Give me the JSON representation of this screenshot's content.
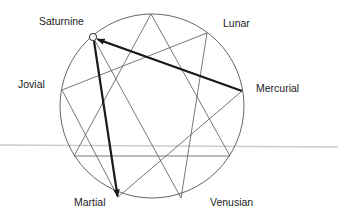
{
  "diagram": {
    "type": "enneagram",
    "labels": {
      "saturnine": "Saturnine",
      "lunar": "Lunar",
      "jovial": "Jovial",
      "mercurial": "Mercurial",
      "martial": "Martial",
      "venusian": "Venusian"
    },
    "colors": {
      "background": "#ffffff",
      "figure_lines": "#555555",
      "arrows": "#1a1a1a",
      "divider": "#cccccc",
      "text": "#222222"
    },
    "circle": {
      "cx": 152,
      "cy": 106,
      "r": 92
    },
    "vertices": [
      {
        "id": "top",
        "x": 151,
        "y": 14
      },
      {
        "id": "upper-right",
        "x": 207,
        "y": 33
      },
      {
        "id": "mercurial",
        "x": 242,
        "y": 91
      },
      {
        "id": "lower-right",
        "x": 230,
        "y": 156
      },
      {
        "id": "venusian",
        "x": 181,
        "y": 198
      },
      {
        "id": "martial",
        "x": 118,
        "y": 197
      },
      {
        "id": "lower-left",
        "x": 74,
        "y": 156
      },
      {
        "id": "jovial",
        "x": 62,
        "y": 90
      },
      {
        "id": "saturnine",
        "x": 93,
        "y": 37
      }
    ],
    "arrows": [
      {
        "from": "Mercurial",
        "to": "Saturnine"
      },
      {
        "from": "Saturnine",
        "to": "Martial"
      }
    ],
    "highlighted_point": "Saturnine"
  }
}
